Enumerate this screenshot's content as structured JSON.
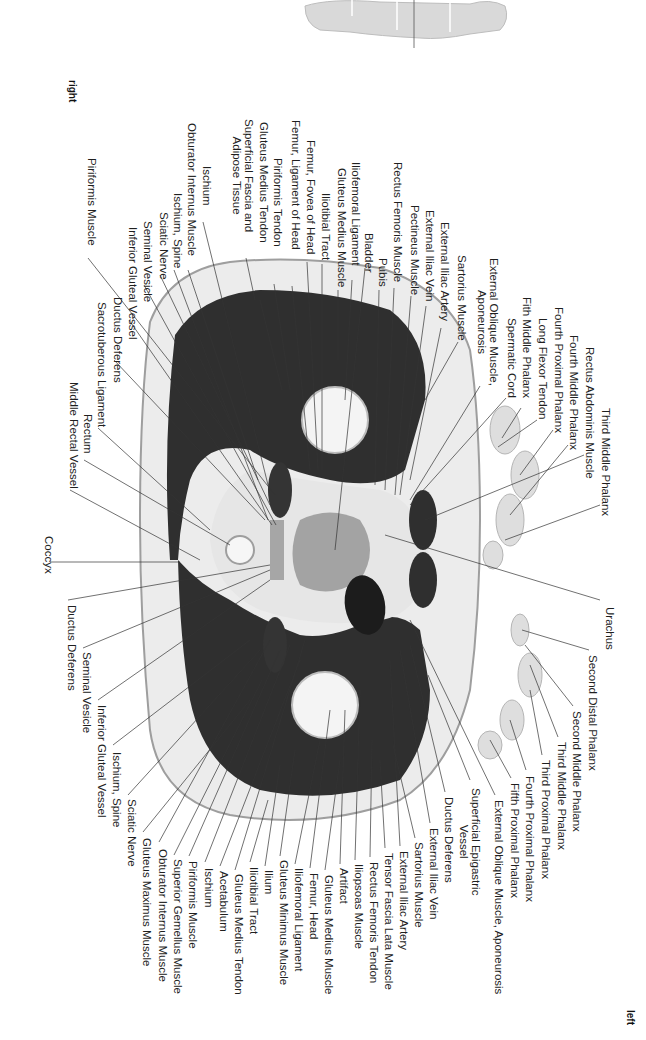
{
  "orientation": {
    "top": "right",
    "bottom": "left"
  },
  "thumbnail": {
    "name": "body-locator",
    "description": "Full body silhouette with section line at pelvis"
  },
  "labels_top": [
    {
      "text": "Piriformis Muscle",
      "x": 86,
      "y": 158
    },
    {
      "text": "Superficial Fascia and\nAdipose Tissue",
      "x": 243,
      "y": 119,
      "multi": true
    },
    {
      "text": "Gluteus Medius Tendon",
      "x": 258,
      "y": 122
    },
    {
      "text": "Piriformis Tendon",
      "x": 272,
      "y": 158
    },
    {
      "text": "Femur, Ligament of Head",
      "x": 290,
      "y": 120
    },
    {
      "text": "Femur, Fovea of Head",
      "x": 305,
      "y": 140
    },
    {
      "text": "Iliotibial Tract",
      "x": 320,
      "y": 193
    },
    {
      "text": "Gluteus Medius Muscle",
      "x": 336,
      "y": 168
    },
    {
      "text": "Iliofemoral Ligament",
      "x": 350,
      "y": 162
    },
    {
      "text": "Bladder",
      "x": 363,
      "y": 233
    },
    {
      "text": "Pubis",
      "x": 377,
      "y": 258
    },
    {
      "text": "Rectus Femoris Muscle",
      "x": 392,
      "y": 162
    },
    {
      "text": "Pectineus Muscle",
      "x": 409,
      "y": 205
    },
    {
      "text": "External Iliac Vein",
      "x": 424,
      "y": 210
    },
    {
      "text": "External Iliac Artery",
      "x": 439,
      "y": 222
    },
    {
      "text": "Sartorius Muscle",
      "x": 456,
      "y": 255
    },
    {
      "text": "External Oblique Muscle,\nAponeurosis",
      "x": 488,
      "y": 258,
      "multi": true
    },
    {
      "text": "Spermatic Cord",
      "x": 506,
      "y": 318
    },
    {
      "text": "Fith Middle Phalanx",
      "x": 521,
      "y": 297
    },
    {
      "text": "Long Flexor Tendon",
      "x": 537,
      "y": 318
    },
    {
      "text": "Fourth Proximal Phalanx",
      "x": 553,
      "y": 307
    },
    {
      "text": "Fourth Middle Phalanx",
      "x": 568,
      "y": 335
    },
    {
      "text": "Rectus Abdominis Muscle",
      "x": 584,
      "y": 347
    },
    {
      "text": "Third Middle Phalanx",
      "x": 600,
      "y": 408
    }
  ],
  "labels_left": [
    {
      "text": "Ischium",
      "x": 201,
      "y": 166
    },
    {
      "text": "Obturator Internus Muscle",
      "x": 186,
      "y": 123
    },
    {
      "text": "Ischium, Spine",
      "x": 172,
      "y": 193
    },
    {
      "text": "Sciatic Nerve",
      "x": 158,
      "y": 212
    },
    {
      "text": "Seminal Vesicle",
      "x": 142,
      "y": 221
    },
    {
      "text": "Inferior Gluteal Vessel",
      "x": 127,
      "y": 227
    },
    {
      "text": "Ductus Deferens",
      "x": 112,
      "y": 297
    },
    {
      "text": "Sacrotuberous Ligament",
      "x": 96,
      "y": 302
    },
    {
      "text": "Rectum",
      "x": 82,
      "y": 414
    },
    {
      "text": "Middle Rectal Vessel",
      "x": 68,
      "y": 382
    },
    {
      "text": "Coccyx",
      "x": 43,
      "y": 536
    }
  ],
  "labels_bottom_left": [
    {
      "text": "Ductus Deferens",
      "x": 66,
      "y": 605
    },
    {
      "text": "Seminal Vesicle",
      "x": 81,
      "y": 652
    },
    {
      "text": "Inferior Gluteal Vessel",
      "x": 96,
      "y": 705
    },
    {
      "text": "Ischium, Spine",
      "x": 111,
      "y": 752
    },
    {
      "text": "Sciatic Nerve",
      "x": 126,
      "y": 799
    },
    {
      "text": "Gluteus Maximus Muscle",
      "x": 141,
      "y": 838
    },
    {
      "text": "Obturator Internus Muscle",
      "x": 157,
      "y": 849
    },
    {
      "text": "Superior Gemellus Muscle",
      "x": 172,
      "y": 859
    },
    {
      "text": "Piriformis Muscle",
      "x": 187,
      "y": 861
    },
    {
      "text": "Ischium",
      "x": 203,
      "y": 868
    },
    {
      "text": "Acetabulum",
      "x": 218,
      "y": 871
    },
    {
      "text": "Gluteus Medius Tendon",
      "x": 233,
      "y": 874
    },
    {
      "text": "Iliotibial Tract",
      "x": 248,
      "y": 867
    },
    {
      "text": "Ilium",
      "x": 263,
      "y": 870
    },
    {
      "text": "Gluteus Minimus Muscle",
      "x": 278,
      "y": 860
    },
    {
      "text": "Iliofemoral Ligament",
      "x": 293,
      "y": 868
    },
    {
      "text": "Femur, Head",
      "x": 308,
      "y": 873
    },
    {
      "text": "Gluteus Medius Muscle",
      "x": 323,
      "y": 875
    },
    {
      "text": "Artifact",
      "x": 338,
      "y": 868
    },
    {
      "text": "Iliopsoas Muscle",
      "x": 353,
      "y": 864
    },
    {
      "text": "Rectus Femoris Tendon",
      "x": 368,
      "y": 862
    },
    {
      "text": "Tensor Fascia Lata Muscle",
      "x": 383,
      "y": 853
    },
    {
      "text": "External Iliac Artery",
      "x": 398,
      "y": 851
    },
    {
      "text": "Sartorius Muscle",
      "x": 413,
      "y": 842
    },
    {
      "text": "External Iliac Vein",
      "x": 428,
      "y": 828
    },
    {
      "text": "Ductus Deferens",
      "x": 443,
      "y": 797
    },
    {
      "text": "Superficial Epigastric\nVessel",
      "x": 470,
      "y": 788,
      "multi": true
    },
    {
      "text": "External Oblique Muscle, Aponeurosis",
      "x": 493,
      "y": 800
    },
    {
      "text": "Fifth Proximal Phalanx",
      "x": 509,
      "y": 783
    },
    {
      "text": "Fourth Proximal Phalanx",
      "x": 524,
      "y": 776
    },
    {
      "text": "Third Proximal Phalanx",
      "x": 540,
      "y": 760
    },
    {
      "text": "Third Middle Phalanx",
      "x": 556,
      "y": 742
    },
    {
      "text": "Second Middle Phalanx",
      "x": 571,
      "y": 711
    },
    {
      "text": "Second Distal Phalanx",
      "x": 587,
      "y": 655
    },
    {
      "text": "Urachus",
      "x": 604,
      "y": 607
    }
  ],
  "colors": {
    "muscle": "#2e2e2e",
    "fat": "#e8e8e8",
    "skin": "#bdbdbd",
    "bone": "#f2f2f2",
    "bladder": "#9a9a9a",
    "line": "#333333",
    "text": "#1f1f1f"
  }
}
